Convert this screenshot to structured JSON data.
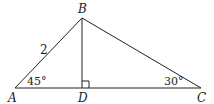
{
  "diagram": {
    "type": "triangle",
    "vertices": {
      "A": {
        "label": "A"
      },
      "B": {
        "label": "B"
      },
      "C": {
        "label": "C"
      },
      "D": {
        "label": "D"
      }
    },
    "side_labels": {
      "AB": "2"
    },
    "angle_labels": {
      "A": "45°",
      "C": "30°"
    },
    "right_angle_at": "D",
    "segments": [
      "AB",
      "BC",
      "AC",
      "BD"
    ],
    "stroke_color": "#222222"
  }
}
